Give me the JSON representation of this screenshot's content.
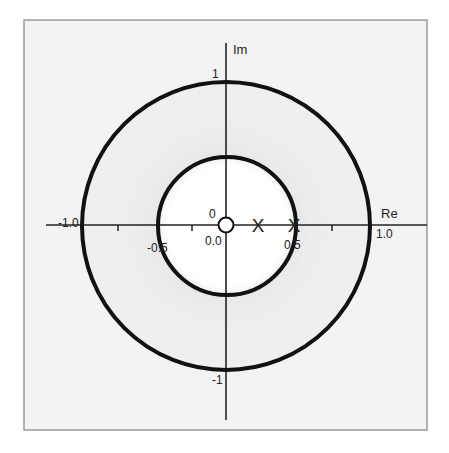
{
  "diagram": {
    "type": "complex-plane-pole-zero-plot",
    "colors": {
      "page_background": "#ffffff",
      "frame_background": "#f3f3f3",
      "frame_border": "#9a9a9a",
      "annulus_fill": "#ececec",
      "inner_disc_fill": "#ffffff",
      "circle_stroke": "#111111",
      "axis_stroke": "#222222",
      "text": "#222222"
    },
    "axes": {
      "real_axis_label": "Re",
      "imag_axis_label": "Im",
      "real_ticks": [
        {
          "value": -1.0,
          "label": "-1.0"
        },
        {
          "value": -0.75,
          "label": ""
        },
        {
          "value": -0.5,
          "label": "-0.5"
        },
        {
          "value": -0.25,
          "label": ""
        },
        {
          "value": 0.0,
          "label": "0.0"
        },
        {
          "value": 0.5,
          "label": "0.5"
        },
        {
          "value": 0.75,
          "label": ""
        },
        {
          "value": 1.0,
          "label": "1.0"
        }
      ],
      "imag_ticks": [
        {
          "value": 1,
          "label": "1"
        },
        {
          "value": -1,
          "label": "-1"
        }
      ]
    },
    "circles": [
      {
        "name": "outer-circle",
        "radius": 1.0
      },
      {
        "name": "inner-circle",
        "radius": 0.5
      }
    ],
    "zeros": [
      {
        "re": 0.0,
        "im": 0.0,
        "label": "0",
        "marker": "o"
      }
    ],
    "poles": [
      {
        "re": 0.25,
        "im": 0.0,
        "marker": "x"
      },
      {
        "re": 0.5,
        "im": 0.0,
        "marker": "x"
      }
    ],
    "labels": {
      "re": "Re",
      "im": "Im",
      "one_real": "1.0",
      "minus_one_real": "-1.0",
      "half_real": "0.5",
      "minus_half_real": "-0.5",
      "zero_real": "0.0",
      "one_imag": "1",
      "minus_one_imag": "-1",
      "zero_marker_label": "0",
      "pole_marker": "X"
    }
  }
}
